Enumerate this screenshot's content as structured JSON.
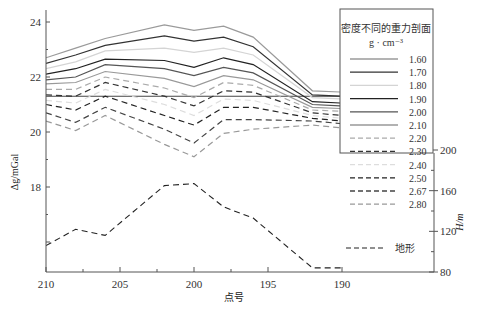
{
  "chart_data": {
    "type": "line",
    "title": "",
    "xlabel": "点号",
    "ylabel": "Δg/mGal",
    "y2label": "H/m",
    "x_ticks": [
      210,
      205,
      200,
      195,
      190
    ],
    "xlim": [
      210,
      187
    ],
    "y_ticks": [
      24,
      22,
      20,
      18
    ],
    "ylim": [
      15.3,
      24.7
    ],
    "y2_ticks": [
      200,
      160,
      120,
      80
    ],
    "y2lim": [
      80,
      200
    ],
    "grid": false,
    "legend": {
      "position": "upper right",
      "title": "密度不同的重力剖面",
      "subtitle": "g · cm⁻³"
    },
    "x": [
      210,
      208,
      206,
      202,
      200,
      198,
      196,
      192,
      190
    ],
    "series": [
      {
        "name": "1.60",
        "style": "solid",
        "color": "#9a9a9a",
        "values": [
          22.7,
          23.05,
          23.4,
          23.9,
          23.7,
          23.85,
          23.45,
          21.5,
          21.45
        ]
      },
      {
        "name": "1.70",
        "style": "solid",
        "color": "#333333",
        "values": [
          22.5,
          22.8,
          23.15,
          23.5,
          23.3,
          23.45,
          23.1,
          21.35,
          21.3
        ]
      },
      {
        "name": "1.80",
        "style": "solid",
        "color": "#d4d4d4",
        "values": [
          22.3,
          22.55,
          22.95,
          23.05,
          22.9,
          23.05,
          22.8,
          21.25,
          21.2
        ]
      },
      {
        "name": "1.90",
        "style": "solid",
        "color": "#222222",
        "values": [
          22.1,
          22.3,
          22.65,
          22.6,
          22.35,
          22.7,
          22.45,
          21.1,
          21.05
        ]
      },
      {
        "name": "2.00",
        "style": "solid",
        "color": "#555555",
        "values": [
          21.9,
          22.0,
          22.45,
          22.3,
          22.05,
          22.35,
          22.15,
          21.0,
          20.95
        ]
      },
      {
        "name": "2.10",
        "style": "solid",
        "color": "#999999",
        "values": [
          21.75,
          21.8,
          22.2,
          21.95,
          21.65,
          22.05,
          21.9,
          20.9,
          20.85
        ]
      },
      {
        "name": "2.20",
        "style": "dashed",
        "color": "#aaaaaa",
        "values": [
          21.55,
          21.55,
          22.0,
          21.6,
          21.25,
          21.8,
          21.7,
          20.8,
          20.75
        ]
      },
      {
        "name": "2.30",
        "style": "dashed",
        "color": "#333333",
        "values": [
          21.35,
          21.3,
          21.8,
          21.3,
          20.95,
          21.5,
          21.45,
          20.7,
          20.6
        ]
      },
      {
        "name": "2.40",
        "style": "dashed",
        "color": "#dddddd",
        "values": [
          21.15,
          21.05,
          21.55,
          21.0,
          20.6,
          21.2,
          21.15,
          20.6,
          20.5
        ]
      },
      {
        "name": "2.50",
        "style": "dashed",
        "color": "#222222",
        "values": [
          21.0,
          20.8,
          21.3,
          20.6,
          20.25,
          20.9,
          20.9,
          20.5,
          20.4
        ]
      },
      {
        "name": "2.67",
        "style": "dashed",
        "color": "#444444",
        "values": [
          20.7,
          20.35,
          20.9,
          20.1,
          19.6,
          20.45,
          20.45,
          20.4,
          20.3
        ]
      },
      {
        "name": "2.80",
        "style": "dashed",
        "color": "#999999",
        "values": [
          20.4,
          20.05,
          20.6,
          19.55,
          19.1,
          19.95,
          20.1,
          20.25,
          20.15
        ]
      }
    ],
    "reference_line": {
      "value": 21.3,
      "color": "#444444"
    },
    "terrain": {
      "name": "地形",
      "style": "dashed",
      "color": "#222222",
      "axis": "right",
      "values": [
        106,
        122,
        116,
        165,
        167,
        144,
        133,
        84,
        84
      ]
    }
  }
}
